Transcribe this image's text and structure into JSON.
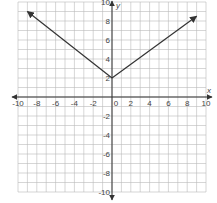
{
  "chart_data": {
    "type": "line",
    "title": "",
    "xlabel": "x",
    "ylabel": "y",
    "xlim": [
      -10,
      10
    ],
    "ylim": [
      -10,
      10
    ],
    "grid": true,
    "x_ticks": [
      -10,
      -8,
      -6,
      -4,
      -2,
      0,
      2,
      4,
      6,
      8,
      10
    ],
    "y_ticks": [
      -10,
      -8,
      -6,
      -4,
      -2,
      2,
      4,
      6,
      8,
      10
    ],
    "series": [
      {
        "name": "absolute value graph",
        "points": [
          [
            -9,
            9
          ],
          [
            0,
            2
          ],
          [
            9,
            8.5
          ]
        ],
        "vertex": [
          0,
          2
        ],
        "arrows": "both ends",
        "color": "#333333"
      }
    ]
  },
  "labels": {
    "x_axis": "x",
    "y_axis": "y",
    "origin": "0"
  }
}
